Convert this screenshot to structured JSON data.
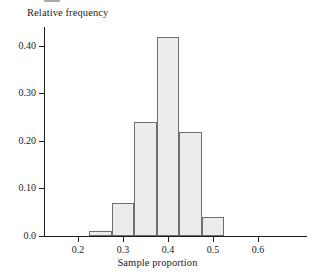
{
  "chart_data": {
    "type": "bar",
    "title": "",
    "xlabel": "Sample proportion",
    "ylabel": "Relative frequency",
    "xlim": [
      0.155,
      0.68
    ],
    "ylim": [
      0.0,
      0.44
    ],
    "grid": false,
    "legend": null,
    "bin_width": 0.05,
    "bin_edges": [
      0.225,
      0.275,
      0.325,
      0.375,
      0.425,
      0.475,
      0.525
    ],
    "categories": [
      "0.225-0.275",
      "0.275-0.325",
      "0.325-0.375",
      "0.375-0.425",
      "0.425-0.475",
      "0.475-0.525"
    ],
    "values": [
      0.01,
      0.07,
      0.24,
      0.42,
      0.22,
      0.04
    ],
    "bar_fill_color": "#ececec",
    "bar_edge_color": "#6e6e6e",
    "xticks": [
      0.2,
      0.3,
      0.4,
      0.5,
      0.6
    ],
    "xtick_labels": [
      "0.2",
      "0.3",
      "0.4",
      "0.5",
      "0.6"
    ],
    "yticks": [
      0.0,
      0.1,
      0.2,
      0.3,
      0.4
    ],
    "ytick_labels": [
      "0.0",
      "0.10",
      "0.20",
      "0.30",
      "0.40"
    ]
  },
  "axes": {
    "y_title": "Relative frequency",
    "x_title": "Sample proportion",
    "y_labels": [
      "0.40",
      "0.30",
      "0.20",
      "0.10",
      "0.0"
    ],
    "x_labels": [
      "0.2",
      "0.3",
      "0.4",
      "0.5",
      "0.6"
    ]
  }
}
